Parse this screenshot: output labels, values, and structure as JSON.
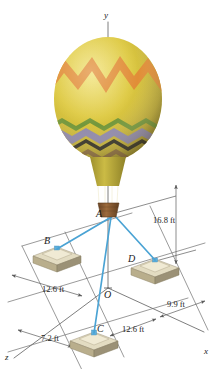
{
  "axes": {
    "y_label": "y",
    "x_label": "x",
    "z_label": "z",
    "origin_label": "O"
  },
  "points": {
    "A": "A",
    "B": "B",
    "C": "C",
    "D": "D"
  },
  "dimensions": [
    {
      "id": "height-A",
      "label": "16.8 ft",
      "axis": "y"
    },
    {
      "id": "B-offset",
      "label": "12.6 ft",
      "axis": "z"
    },
    {
      "id": "D-offset",
      "label": "9.9 ft",
      "axis": "x"
    },
    {
      "id": "C-offset-x",
      "label": "12.6 ft",
      "axis": "x"
    },
    {
      "id": "C-offset-z",
      "label": "7.2 ft",
      "axis": "z"
    }
  ],
  "colors": {
    "cable": "#4aa3d4",
    "cable_dark": "#2f86bd",
    "axis_line": "#6f6f6f",
    "dim_line": "#5b5b5b",
    "balloon_yellow": "#ddc83c",
    "balloon_yellow_light": "#e8d85a",
    "balloon_orange": "#e08a30",
    "balloon_green": "#7d9a3b",
    "balloon_purple": "#8d86a8",
    "balloon_brown": "#8a6a3a",
    "balloon_dark": "#2d2a1e",
    "basket": "#8a5a33",
    "anchor_block": "#cfc5a3",
    "anchor_block_dark": "#a99f7e",
    "anchor_top": "#e3dcc2",
    "text": "#1b1b1b"
  },
  "balloon": {
    "pattern": "zigzag-chevron",
    "upper_pattern": "orange-zigzag",
    "lower_bands": [
      "green",
      "purple",
      "brown",
      "dark",
      "yellow"
    ]
  }
}
